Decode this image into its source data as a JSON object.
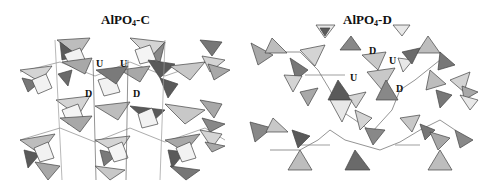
{
  "figure": {
    "panels": [
      {
        "id": "C",
        "title_main": "AlPO",
        "title_sub": "4",
        "title_suffix": "-C",
        "labels": [
          {
            "text": "U",
            "x": 96,
            "y": 58
          },
          {
            "text": "U",
            "x": 120,
            "y": 58
          },
          {
            "text": "D",
            "x": 85,
            "y": 88
          },
          {
            "text": "D",
            "x": 133,
            "y": 88
          }
        ]
      },
      {
        "id": "D",
        "title_main": "AlPO",
        "title_sub": "4",
        "title_suffix": "-D",
        "labels": [
          {
            "text": "D",
            "x": 369,
            "y": 45
          },
          {
            "text": "U",
            "x": 389,
            "y": 55
          },
          {
            "text": "U",
            "x": 350,
            "y": 72
          },
          {
            "text": "D",
            "x": 396,
            "y": 83
          }
        ]
      }
    ],
    "colors": {
      "light": "#d4d4d4",
      "mid": "#a8a8a8",
      "dark": "#5a5a5a",
      "edge": "#333333"
    }
  }
}
